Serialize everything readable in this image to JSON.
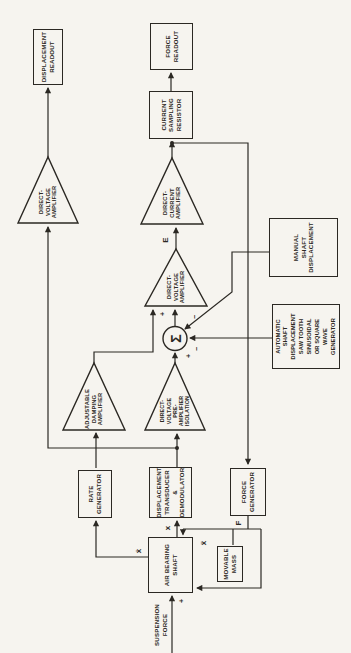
{
  "diagram": {
    "title_hint": "force-balance system block diagram",
    "colors": {
      "ink": "#2b2823",
      "paper": "#f6f4ef"
    },
    "boxes": {
      "displacement_readout": {
        "label": "DISPLACEMENT\nREADOUT"
      },
      "force_readout": {
        "label": "FORCE\nREADOUT"
      },
      "current_sampling_resistor": {
        "label": "CURRENT\nSAMPLING\nRESISTOR"
      },
      "manual_shaft_displacement": {
        "label": "MANUAL\nSHAFT\nDISPLACEMENT"
      },
      "automatic_generator": {
        "label": "AUTOMATIC\nSHAFT\nDISPLACEMENT\nSAW TOOTH\nSINUSOIDAL\nOR SQUARE\nWAVE\nGENERATOR"
      },
      "rate_generator": {
        "label": "RATE\nGENERATOR"
      },
      "displacement_transducer": {
        "label": "DISPLACEMENT\nTRANSDUCER\n&\nDEMODULATOR"
      },
      "force_generator": {
        "label": "FORCE\nGENERATOR"
      },
      "air_bearing_shaft": {
        "label": "AIR BEARING\nSHAFT"
      },
      "movable_mass": {
        "label": "MOVABLE\nMASS"
      }
    },
    "amplifiers": {
      "direct_voltage_amplifier_readout": {
        "label": "DIRECT-\nVOLTAGE\nAMPLIFIER"
      },
      "direct_current_amplifier": {
        "label": "DIRECT-\nCURRENT\nAMPLIFIER"
      },
      "direct_voltage_amplifier_loop": {
        "label": "DIRECT-\nVOLTAGE\nAMPLIFIER"
      },
      "adjustable_damping_amplifier": {
        "label": "ADJUSTABLE\nDAMPING\nAMPLIFIER"
      },
      "preamplifier": {
        "label": "DIRECT-\nVOLTAGE\nPRE-\nAMPLIFIER\nISOLATION"
      }
    },
    "signals": {
      "suspension_force": "SUSPENSION\nFORCE",
      "sum": "Σ",
      "e": "E",
      "x": "x",
      "x_dot": "ẋ",
      "x_ddot": "ẍ",
      "f": "F",
      "plus_suspension": "+",
      "plus_preamp_input": "+",
      "plus_loop_input": "+",
      "minus_manual_input": "−",
      "minus_automatic_input": "−"
    }
  }
}
